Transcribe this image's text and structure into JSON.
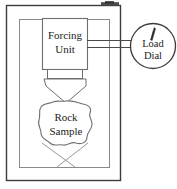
{
  "figure": {
    "type": "technical-schematic",
    "background_color": "#ffffff",
    "line_color": "#6b6b6b",
    "dark_line_color": "#3c3c3c",
    "text_color": "#1a1a1a"
  },
  "labels": {
    "forcing_unit_line1": "Forcing",
    "forcing_unit_line2": "Unit",
    "rock_sample_line1": "Rock",
    "rock_sample_line2": "Sample",
    "load_dial_line1": "Load",
    "load_dial_line2": "Dial"
  },
  "parts": {
    "outer_frame": "outer-frame",
    "inner_frame": "inner-frame",
    "forcing_unit_box": "forcing-unit-box",
    "connector_block": "connector-block",
    "platen_wedge": "platen-wedge",
    "rock_sample_blob": "rock-sample-blob",
    "base_cross_supports": "base-cross-supports",
    "load_dial_gauge": "load-dial-gauge",
    "dial_needle": "dial-needle",
    "linkage_upper": "linkage-line-upper",
    "linkage_lower": "linkage-line-lower",
    "top_marker": "top-frame-marker"
  }
}
